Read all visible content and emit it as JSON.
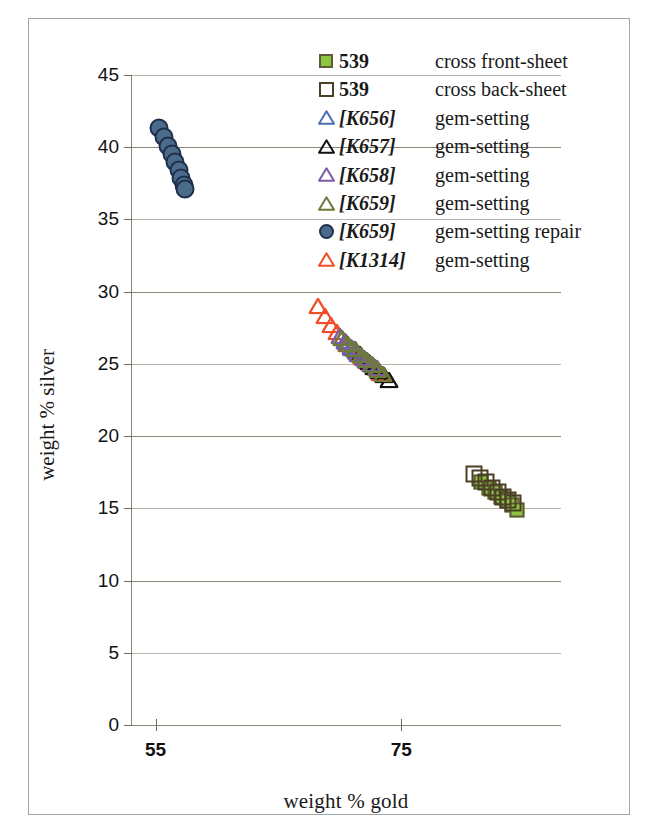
{
  "figure": {
    "xlabel": "weight % gold",
    "ylabel": "weight % silver"
  },
  "axes": {
    "y_ticks": [
      "45",
      "40",
      "35",
      "30",
      "25",
      "20",
      "15",
      "10",
      "5",
      "0"
    ],
    "x_ticks": [
      "55",
      "75"
    ]
  },
  "legend": {
    "entries": [
      {
        "marker": "square-filled-green",
        "key": "539",
        "key_italic": false,
        "desc": "cross front-sheet",
        "color": "#8cc63f"
      },
      {
        "marker": "square-open-dark",
        "key": "539",
        "key_italic": false,
        "desc": "cross back-sheet",
        "color": "#4b3f25"
      },
      {
        "marker": "triangle-open-blue",
        "key": "[K656]",
        "key_italic": true,
        "desc": "gem-setting",
        "color": "#4a6fb5"
      },
      {
        "marker": "triangle-open-black",
        "key": "[K657]",
        "key_italic": true,
        "desc": "gem-setting",
        "color": "#111111"
      },
      {
        "marker": "triangle-open-purple",
        "key": "[K658]",
        "key_italic": true,
        "desc": "gem-setting",
        "color": "#7d5ba6"
      },
      {
        "marker": "triangle-open-olive",
        "key": "[K659]",
        "key_italic": true,
        "desc": "gem-setting",
        "color": "#6d7a3a"
      },
      {
        "marker": "circle-filled-blue",
        "key": "[K659]",
        "key_italic": true,
        "desc": "gem-setting repair",
        "color": "#4a6b8a"
      },
      {
        "marker": "triangle-open-red",
        "key": "[K1314]",
        "key_italic": true,
        "desc": "gem-setting",
        "color": "#f04d28"
      }
    ]
  },
  "chart_data": {
    "type": "scatter",
    "title": "",
    "xlabel": "weight % gold",
    "ylabel": "weight % silver",
    "xlim": [
      53,
      88
    ],
    "ylim": [
      0,
      45
    ],
    "xticks": [
      55,
      75
    ],
    "yticks": [
      0,
      5,
      10,
      15,
      20,
      25,
      30,
      35,
      40,
      45
    ],
    "grid": "horizontal",
    "legend_position": "top-right",
    "series": [
      {
        "name": "[K659] gem-setting repair",
        "marker": "circle-filled-blue",
        "color": "#4a6b8a",
        "points": [
          [
            55.3,
            41.3
          ],
          [
            55.7,
            40.7
          ],
          [
            56.0,
            40.1
          ],
          [
            56.3,
            39.5
          ],
          [
            56.6,
            39.0
          ],
          [
            56.9,
            38.4
          ],
          [
            57.1,
            37.9
          ],
          [
            57.3,
            37.4
          ],
          [
            57.4,
            37.1
          ]
        ]
      },
      {
        "name": "[K1314] gem-setting",
        "marker": "triangle-open-red",
        "color": "#f04d28",
        "points": [
          [
            68.2,
            29.0
          ],
          [
            68.8,
            28.3
          ],
          [
            69.3,
            27.7
          ],
          [
            69.8,
            27.2
          ],
          [
            70.2,
            26.8
          ],
          [
            70.6,
            26.4
          ],
          [
            71.0,
            26.1
          ],
          [
            71.4,
            25.8
          ],
          [
            71.8,
            25.5
          ],
          [
            72.2,
            25.2
          ],
          [
            72.6,
            25.0
          ],
          [
            73.0,
            24.7
          ],
          [
            73.3,
            24.4
          ]
        ]
      },
      {
        "name": "[K656] gem-setting",
        "marker": "triangle-open-blue",
        "color": "#4a6fb5",
        "points": [
          [
            70.4,
            26.6
          ],
          [
            70.9,
            26.2
          ],
          [
            71.3,
            25.9
          ],
          [
            71.7,
            25.6
          ],
          [
            72.1,
            25.3
          ],
          [
            72.5,
            25.0
          ],
          [
            72.9,
            24.8
          ]
        ]
      },
      {
        "name": "[K657] gem-setting",
        "marker": "triangle-open-black",
        "color": "#111111",
        "points": [
          [
            71.2,
            26.0
          ],
          [
            71.6,
            25.7
          ],
          [
            72.0,
            25.4
          ],
          [
            72.4,
            25.1
          ],
          [
            72.8,
            24.8
          ],
          [
            73.2,
            24.5
          ],
          [
            73.6,
            24.2
          ],
          [
            74.0,
            23.9
          ]
        ]
      },
      {
        "name": "[K658] gem-setting",
        "marker": "triangle-open-purple",
        "color": "#7d5ba6",
        "points": [
          [
            70.0,
            26.9
          ],
          [
            70.5,
            26.5
          ],
          [
            71.0,
            26.1
          ],
          [
            71.5,
            25.7
          ],
          [
            72.0,
            25.4
          ],
          [
            72.5,
            25.0
          ],
          [
            73.0,
            24.7
          ]
        ]
      },
      {
        "name": "[K659] gem-setting",
        "marker": "triangle-open-olive",
        "color": "#6d7a3a",
        "points": [
          [
            70.2,
            26.8
          ],
          [
            70.7,
            26.4
          ],
          [
            71.2,
            26.0
          ],
          [
            71.7,
            25.6
          ],
          [
            72.2,
            25.3
          ],
          [
            72.7,
            24.9
          ],
          [
            73.1,
            24.6
          ],
          [
            73.5,
            24.3
          ]
        ]
      },
      {
        "name": "539 cross front-sheet",
        "marker": "square-filled-green",
        "color": "#8cc63f",
        "points": [
          [
            81.5,
            16.8
          ],
          [
            82.1,
            16.4
          ],
          [
            82.6,
            16.1
          ],
          [
            83.1,
            15.8
          ],
          [
            83.6,
            15.5
          ],
          [
            84.0,
            15.2
          ],
          [
            84.4,
            14.9
          ]
        ]
      },
      {
        "name": "539 cross back-sheet",
        "marker": "square-open-dark",
        "color": "#4b3f25",
        "points": [
          [
            80.9,
            17.4
          ],
          [
            81.4,
            17.1
          ],
          [
            81.9,
            16.8
          ],
          [
            82.4,
            16.4
          ],
          [
            82.9,
            16.1
          ],
          [
            83.3,
            15.8
          ],
          [
            83.7,
            15.6
          ],
          [
            84.1,
            15.4
          ]
        ]
      }
    ]
  }
}
